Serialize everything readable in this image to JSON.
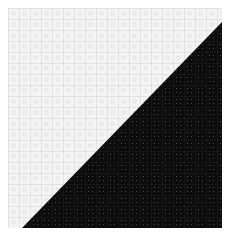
{
  "image": {
    "description": "diagonally split square texture tile",
    "light_region": {
      "color": "#f4f4f4",
      "grid_color": "#c8c8c8",
      "dot_color": "#d8d8d8"
    },
    "dark_region": {
      "color": "#0c0c0c",
      "grid_color": "#2a2a2a",
      "dot_color": "#5a5a5a"
    },
    "grid_spacing": 11
  }
}
